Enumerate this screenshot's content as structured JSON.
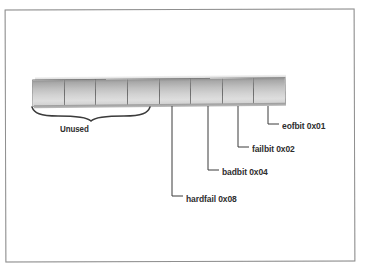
{
  "figure": {
    "bit_count": 8,
    "colors": {
      "frame_border": "#8d8d8d",
      "cell_divider": "#6f6f6f",
      "text": "#2e2e2e",
      "leader_line": "#3b3b3b",
      "bar_light": "#dedede",
      "bar_dark": "#8f8f8f"
    }
  },
  "bar": {
    "cells": [
      {
        "index": 7,
        "label": ""
      },
      {
        "index": 6,
        "label": ""
      },
      {
        "index": 5,
        "label": ""
      },
      {
        "index": 4,
        "label": ""
      },
      {
        "index": 3,
        "label": ""
      },
      {
        "index": 2,
        "label": ""
      },
      {
        "index": 1,
        "label": ""
      },
      {
        "index": 0,
        "label": ""
      }
    ]
  },
  "brace": {
    "label": "Unused"
  },
  "callouts": [
    {
      "name": "hardfail",
      "text": "hardfail 0x08",
      "value": "0x08"
    },
    {
      "name": "badbit",
      "text": "badbit 0x04",
      "value": "0x04"
    },
    {
      "name": "failbit",
      "text": "failbit 0x02",
      "value": "0x02"
    },
    {
      "name": "eofbit",
      "text": "eofbit 0x01",
      "value": "0x01"
    }
  ]
}
